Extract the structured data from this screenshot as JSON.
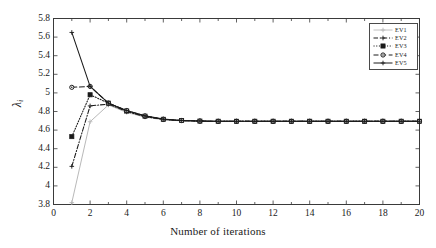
{
  "chart_data": {
    "type": "line",
    "title": "",
    "xlabel": "Number of iterations",
    "ylabel": "λ",
    "ylabel_sub": "i",
    "xlim": [
      0,
      20
    ],
    "ylim": [
      3.8,
      5.8
    ],
    "grid": false,
    "legend_position": "top-right-inside",
    "xticks": [
      0,
      2,
      4,
      6,
      8,
      10,
      12,
      14,
      16,
      18,
      20
    ],
    "xtick_labels": [
      "0",
      "2",
      "4",
      "6",
      "8",
      "10",
      "12",
      "14",
      "16",
      "18",
      "20"
    ],
    "xticks_minor": [
      1,
      3,
      5,
      7,
      9,
      11,
      13,
      15,
      17,
      19
    ],
    "yticks": [
      3.8,
      4,
      4.2,
      4.4,
      4.6,
      4.8,
      5,
      5.2,
      5.4,
      5.6,
      5.8
    ],
    "ytick_labels": [
      "3.8",
      "4",
      "4.2",
      "4.4",
      "4.6",
      "4.8",
      "5",
      "5.2",
      "5.4",
      "5.6",
      "5.8"
    ],
    "x": [
      1,
      2,
      3,
      4,
      5,
      6,
      7,
      8,
      9,
      10,
      11,
      12,
      13,
      14,
      15,
      16,
      17,
      18,
      19,
      20
    ],
    "series": [
      {
        "name": "EV1",
        "color": "#b9b9b9",
        "marker": "plus",
        "dash": "solid",
        "values": [
          3.82,
          4.69,
          4.87,
          4.79,
          4.74,
          4.71,
          4.7,
          4.695,
          4.695,
          4.695,
          4.695,
          4.695,
          4.695,
          4.695,
          4.695,
          4.695,
          4.695,
          4.695,
          4.695,
          4.695
        ]
      },
      {
        "name": "EV2",
        "color": "#1a1a1a",
        "marker": "plus",
        "dash": "dashdot",
        "values": [
          4.21,
          4.86,
          4.88,
          4.8,
          4.745,
          4.715,
          4.702,
          4.697,
          4.695,
          4.695,
          4.695,
          4.695,
          4.695,
          4.695,
          4.695,
          4.695,
          4.695,
          4.695,
          4.695,
          4.695
        ]
      },
      {
        "name": "EV3",
        "color": "#1a1a1a",
        "marker": "square",
        "dash": "dotted",
        "values": [
          4.53,
          4.98,
          4.89,
          4.805,
          4.75,
          4.716,
          4.703,
          4.697,
          4.695,
          4.695,
          4.695,
          4.695,
          4.695,
          4.695,
          4.695,
          4.695,
          4.695,
          4.695,
          4.695,
          4.695
        ]
      },
      {
        "name": "EV4",
        "color": "#1a1a1a",
        "marker": "circle",
        "dash": "dashed",
        "values": [
          5.06,
          5.07,
          4.89,
          4.81,
          4.752,
          4.717,
          4.703,
          4.697,
          4.695,
          4.695,
          4.695,
          4.695,
          4.695,
          4.695,
          4.695,
          4.695,
          4.695,
          4.695,
          4.695,
          4.695
        ]
      },
      {
        "name": "EV5",
        "color": "#1a1a1a",
        "marker": "plus",
        "dash": "solid",
        "values": [
          5.65,
          5.07,
          4.89,
          4.81,
          4.753,
          4.718,
          4.704,
          4.698,
          4.695,
          4.695,
          4.695,
          4.695,
          4.695,
          4.695,
          4.695,
          4.695,
          4.695,
          4.695,
          4.695,
          4.695
        ]
      }
    ]
  }
}
